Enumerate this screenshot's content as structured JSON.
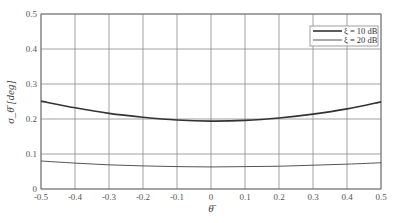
{
  "chart_data": {
    "type": "line",
    "title": "",
    "xlabel": "θ̄",
    "ylabel": "σ_θ̄ [deg]",
    "xlim": [
      -0.5,
      0.5
    ],
    "ylim": [
      0,
      0.5
    ],
    "grid": true,
    "legend_position": "upper right",
    "x_ticks": [
      "-0.5",
      "-0.4",
      "-0.3",
      "-0.2",
      "-0.1",
      "0",
      "0.1",
      "0.2",
      "0.3",
      "0.4",
      "0.5"
    ],
    "y_ticks": [
      "0",
      "0.1",
      "0.2",
      "0.3",
      "0.4",
      "0.5"
    ],
    "x": [
      -0.5,
      -0.4,
      -0.3,
      -0.2,
      -0.1,
      0,
      0.1,
      0.2,
      0.3,
      0.4,
      0.5
    ],
    "series": [
      {
        "name": "ξ = 10 dB",
        "color": "#333333",
        "width": 1.6,
        "values": [
          0.251,
          0.232,
          0.216,
          0.205,
          0.197,
          0.194,
          0.196,
          0.203,
          0.214,
          0.229,
          0.249
        ]
      },
      {
        "name": "ξ = 20 dB",
        "color": "#555555",
        "width": 1.0,
        "values": [
          0.08,
          0.074,
          0.069,
          0.066,
          0.064,
          0.063,
          0.064,
          0.065,
          0.068,
          0.071,
          0.075
        ]
      }
    ]
  }
}
